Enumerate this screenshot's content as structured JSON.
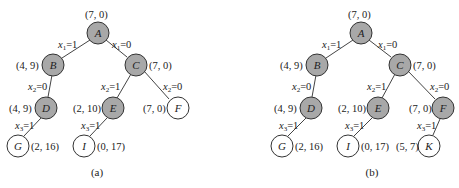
{
  "diagrams": [
    {
      "caption": "(a)",
      "nodes": [
        {
          "id": "A",
          "label": "A",
          "value": "(7, 0)",
          "shaded": true
        },
        {
          "id": "B",
          "label": "B",
          "value": "(4, 9)",
          "shaded": true
        },
        {
          "id": "C",
          "label": "C",
          "value": "(7, 0)",
          "shaded": true
        },
        {
          "id": "D",
          "label": "D",
          "value": "(4, 9)",
          "shaded": true
        },
        {
          "id": "E",
          "label": "E",
          "value": "(2, 10)",
          "shaded": true
        },
        {
          "id": "F",
          "label": "F",
          "value": "(7, 0)",
          "shaded": false
        },
        {
          "id": "G",
          "label": "G",
          "value": "(2, 16)",
          "shaded": false
        },
        {
          "id": "I",
          "label": "I",
          "value": "(0, 17)",
          "shaded": false
        }
      ],
      "edges": [
        {
          "from": "A",
          "to": "B",
          "var": "x",
          "sub": "1",
          "eq": "=1"
        },
        {
          "from": "A",
          "to": "C",
          "var": "x",
          "sub": "1",
          "eq": "=0"
        },
        {
          "from": "B",
          "to": "D",
          "var": "x",
          "sub": "2",
          "eq": "=0"
        },
        {
          "from": "C",
          "to": "E",
          "var": "x",
          "sub": "2",
          "eq": "=1"
        },
        {
          "from": "C",
          "to": "F",
          "var": "x",
          "sub": "2",
          "eq": "=0"
        },
        {
          "from": "D",
          "to": "G",
          "var": "x",
          "sub": "3",
          "eq": "=1"
        },
        {
          "from": "E",
          "to": "I",
          "var": "x",
          "sub": "3",
          "eq": "=1"
        }
      ]
    },
    {
      "caption": "(b)",
      "nodes": [
        {
          "id": "A",
          "label": "A",
          "value": "(7, 0)",
          "shaded": true
        },
        {
          "id": "B",
          "label": "B",
          "value": "(4, 9)",
          "shaded": true
        },
        {
          "id": "C",
          "label": "C",
          "value": "(7, 0)",
          "shaded": true
        },
        {
          "id": "D",
          "label": "D",
          "value": "(4, 9)",
          "shaded": true
        },
        {
          "id": "E",
          "label": "E",
          "value": "(2, 10)",
          "shaded": true
        },
        {
          "id": "F",
          "label": "F",
          "value": "(7, 0)",
          "shaded": true
        },
        {
          "id": "G",
          "label": "G",
          "value": "(2, 16)",
          "shaded": false
        },
        {
          "id": "I",
          "label": "I",
          "value": "(0, 17)",
          "shaded": false
        },
        {
          "id": "K",
          "label": "K",
          "value": "(5, 7)",
          "shaded": false
        }
      ],
      "edges": [
        {
          "from": "A",
          "to": "B",
          "var": "x",
          "sub": "1",
          "eq": "=1"
        },
        {
          "from": "A",
          "to": "C",
          "var": "x",
          "sub": "1",
          "eq": "=0"
        },
        {
          "from": "B",
          "to": "D",
          "var": "x",
          "sub": "2",
          "eq": "=0"
        },
        {
          "from": "C",
          "to": "E",
          "var": "x",
          "sub": "2",
          "eq": "=1"
        },
        {
          "from": "C",
          "to": "F",
          "var": "x",
          "sub": "2",
          "eq": "=0"
        },
        {
          "from": "D",
          "to": "G",
          "var": "x",
          "sub": "3",
          "eq": "=1"
        },
        {
          "from": "E",
          "to": "I",
          "var": "x",
          "sub": "3",
          "eq": "=1"
        },
        {
          "from": "F",
          "to": "K",
          "var": "x",
          "sub": "3",
          "eq": "=1"
        }
      ]
    }
  ]
}
